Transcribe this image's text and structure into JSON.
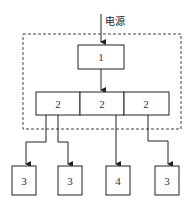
{
  "caption_cut": "…………采用各种配置方式……",
  "diagram": {
    "power_label": "电源",
    "top_box": "1",
    "middle_boxes": [
      "2",
      "2",
      "2"
    ],
    "bottom_boxes": [
      "3",
      "3",
      "4",
      "3"
    ]
  }
}
